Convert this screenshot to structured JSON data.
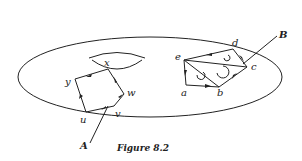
{
  "figure": {
    "caption": "Figure 8.2",
    "surface": "torus",
    "cycle_A": {
      "label": "A",
      "vertices": [
        "x",
        "w",
        "v",
        "u",
        "y"
      ]
    },
    "cycle_B": {
      "label": "B",
      "vertices": [
        "a",
        "b",
        "c",
        "d",
        "e"
      ]
    },
    "labels": {
      "x": "x",
      "y": "y",
      "w": "w",
      "u": "u",
      "v": "v",
      "a": "a",
      "b": "b",
      "c": "c",
      "d": "d",
      "e": "e",
      "A": "A",
      "B": "B"
    }
  }
}
